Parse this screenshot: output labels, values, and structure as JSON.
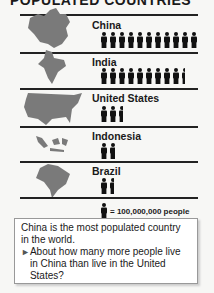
{
  "title": "POPULATED COUNTRIES",
  "chart_data": {
    "type": "pictograph",
    "title": "POPULATED COUNTRIES",
    "unit_label": "= 100,000,000 people",
    "unit_value": 100000000,
    "categories": [
      "China",
      "India",
      "United States",
      "Indonesia",
      "Brazil"
    ],
    "values": [
      11,
      9.5,
      2.6,
      1.7,
      1.6
    ],
    "approx_population": [
      1100000000,
      950000000,
      260000000,
      170000000,
      160000000
    ]
  },
  "rows": [
    {
      "label": "China",
      "icons": 11
    },
    {
      "label": "India",
      "icons": 9.5
    },
    {
      "label": "United States",
      "icons": 2.6
    },
    {
      "label": "Indonesia",
      "icons": 1.7
    },
    {
      "label": "Brazil",
      "icons": 1.6
    }
  ],
  "legend": {
    "text": "= 100,000,000 people"
  },
  "callout": {
    "statement": "China is the most populated country in the world.",
    "question": "About how many more people live in China than live in the United States?"
  }
}
